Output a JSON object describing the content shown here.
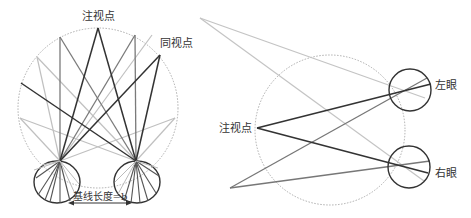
{
  "left_panel": {
    "fixation_label": "注视点",
    "corresponding_label": "同视点",
    "baseline_label": "基线长度=b",
    "horopter_circle": {
      "cx": 98,
      "cy": 108,
      "r": 80
    },
    "eyes": [
      {
        "cx": 57,
        "cy": 182,
        "rx": 23,
        "ry": 21,
        "node": [
          60,
          161
        ]
      },
      {
        "cx": 137,
        "cy": 182,
        "rx": 23,
        "ry": 21,
        "node": [
          136,
          161
        ]
      }
    ]
  },
  "right_panel": {
    "fixation_label": "注视点",
    "left_eye_label": "左眼",
    "right_eye_label": "右眼",
    "horopter_circle": {
      "cx": 330,
      "cy": 130,
      "r": 75
    },
    "left_eye": {
      "cx": 410,
      "cy": 90,
      "r": 21
    },
    "right_eye": {
      "cx": 409,
      "cy": 167,
      "r": 21
    }
  },
  "colors": {
    "dark_line": "#333333",
    "mid_line": "#777777",
    "light_line": "#bbbbbb",
    "dotted_circle": "#999999",
    "eye_outline": "#333333"
  }
}
